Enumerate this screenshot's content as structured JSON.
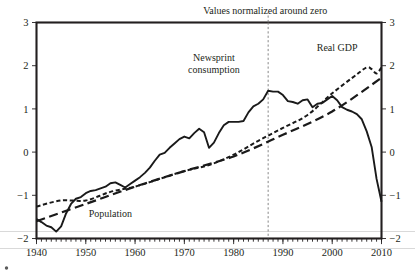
{
  "chart_data": {
    "type": "line",
    "title": "Values normalized around zero",
    "xlabel": "",
    "ylabel": "",
    "xlim": [
      1940,
      2010
    ],
    "ylim": [
      -2,
      3
    ],
    "grid": false,
    "legend_position": "inline-annotations",
    "x_ticks": [
      "1940",
      "1950",
      "1960",
      "1970",
      "1980",
      "1990",
      "2000",
      "2010"
    ],
    "x_tick_values": [
      1940,
      1950,
      1960,
      1970,
      1980,
      1990,
      2000,
      2010
    ],
    "y_ticks": [
      "3",
      "2",
      "1",
      "0",
      "-1",
      "-2"
    ],
    "y_tick_values": [
      3,
      2,
      1,
      0,
      -1,
      -2
    ],
    "right_axis_ticks": [
      "3",
      "2",
      "1",
      "0",
      "-1",
      "-2"
    ],
    "minor_tick_interval": 1,
    "annotations": [
      {
        "name": "newsprint-consumption-label",
        "text": "Newsprint\nconsumption",
        "line1": "Newsprint",
        "line2": "consumption",
        "x": 1976,
        "y": 2.1
      },
      {
        "name": "real-gdp-label",
        "text": "Real GDP",
        "x": 2001,
        "y": 2.35
      },
      {
        "name": "population-label",
        "text": "Population",
        "x": 1955,
        "y": -1.5
      },
      {
        "name": "normalization-note",
        "text": "Values normalized around zero",
        "x": 1999,
        "y": 3.2
      }
    ],
    "marker_line": {
      "name": "peak-year-marker",
      "x": 1987,
      "style": "dashed",
      "color": "#7b7b7b"
    },
    "series": [
      {
        "name": "Newsprint consumption",
        "style": "solid",
        "color": "#1a1a1a",
        "x": [
          1940,
          1941,
          1942,
          1943,
          1944,
          1945,
          1946,
          1947,
          1948,
          1949,
          1950,
          1951,
          1952,
          1953,
          1954,
          1955,
          1956,
          1957,
          1958,
          1959,
          1960,
          1961,
          1962,
          1963,
          1964,
          1965,
          1966,
          1967,
          1968,
          1969,
          1970,
          1971,
          1972,
          1973,
          1974,
          1975,
          1976,
          1977,
          1978,
          1979,
          1980,
          1981,
          1982,
          1983,
          1984,
          1985,
          1986,
          1987,
          1988,
          1989,
          1990,
          1991,
          1992,
          1993,
          1994,
          1995,
          1996,
          1997,
          1998,
          1999,
          2000,
          2001,
          2002,
          2003,
          2004,
          2005,
          2006,
          2007,
          2008,
          2009,
          2010
        ],
        "values": [
          -1.55,
          -1.62,
          -1.7,
          -1.74,
          -1.84,
          -1.72,
          -1.42,
          -1.2,
          -1.08,
          -1.04,
          -0.95,
          -0.9,
          -0.88,
          -0.84,
          -0.8,
          -0.72,
          -0.7,
          -0.76,
          -0.82,
          -0.74,
          -0.66,
          -0.58,
          -0.48,
          -0.36,
          -0.2,
          -0.06,
          -0.02,
          0.1,
          0.2,
          0.3,
          0.36,
          0.32,
          0.44,
          0.54,
          0.46,
          0.1,
          0.22,
          0.44,
          0.62,
          0.7,
          0.7,
          0.7,
          0.72,
          0.92,
          1.06,
          1.12,
          1.22,
          1.42,
          1.4,
          1.4,
          1.32,
          1.18,
          1.16,
          1.12,
          1.2,
          1.22,
          1.04,
          1.12,
          1.14,
          1.22,
          1.3,
          1.2,
          1.04,
          0.98,
          0.94,
          0.88,
          0.76,
          0.48,
          0.12,
          -0.62,
          -1.15
        ]
      },
      {
        "name": "Real GDP",
        "style": "short-dash",
        "color": "#1a1a1a",
        "x": [
          1940,
          1945,
          1950,
          1955,
          1960,
          1965,
          1970,
          1975,
          1980,
          1985,
          1990,
          1995,
          2000,
          2005,
          2007,
          2008,
          2009,
          2010
        ],
        "values": [
          -1.26,
          -1.12,
          -1.12,
          -0.92,
          -0.8,
          -0.62,
          -0.44,
          -0.3,
          -0.06,
          0.26,
          0.56,
          0.86,
          1.36,
          1.8,
          1.96,
          1.92,
          1.82,
          1.96
        ]
      },
      {
        "name": "Population",
        "style": "long-dash",
        "color": "#1a1a1a",
        "x": [
          1940,
          1950,
          1960,
          1970,
          1980,
          1990,
          2000,
          2010
        ],
        "values": [
          -1.6,
          -1.2,
          -0.8,
          -0.44,
          -0.1,
          0.4,
          0.94,
          1.72
        ]
      }
    ]
  }
}
